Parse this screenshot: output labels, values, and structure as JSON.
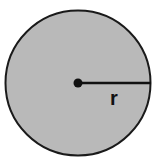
{
  "diagram": {
    "shape": "circle",
    "fill_color": "#b9b9b9",
    "stroke_color": "#1a1a1a",
    "center": {
      "x": 78,
      "y": 83
    },
    "radius": 73,
    "radius_label": "r"
  }
}
